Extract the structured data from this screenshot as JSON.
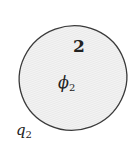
{
  "region": {
    "number_label": "2",
    "field_symbol": "ϕ",
    "field_subscript": "2",
    "charge_symbol": "q",
    "charge_subscript": "2"
  },
  "colors": {
    "fill": "#e9e9e9",
    "hatch": "#f6f6f6",
    "outline": "#3a3a3a",
    "text": "#222222"
  }
}
